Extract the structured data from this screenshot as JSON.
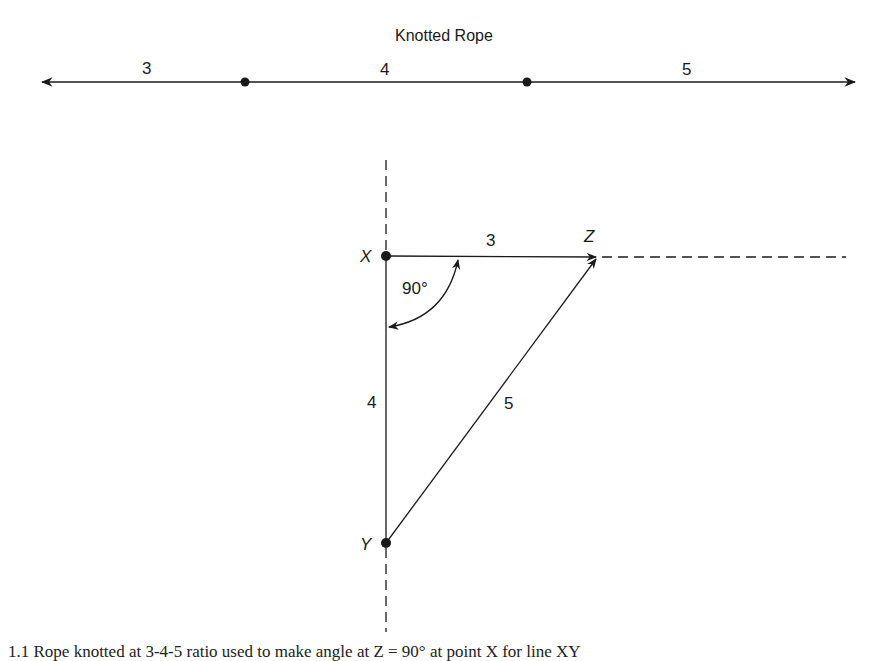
{
  "rope": {
    "title": "Knotted Rope",
    "segments": [
      {
        "label": "3"
      },
      {
        "label": "4"
      },
      {
        "label": "5"
      }
    ],
    "knot_count": 2
  },
  "triangle": {
    "points": {
      "X": {
        "label": "X"
      },
      "Y": {
        "label": "Y"
      },
      "Z": {
        "label": "Z"
      }
    },
    "sides": {
      "XZ": "3",
      "XY": "4",
      "YZ": "5"
    },
    "angle_label": "90°"
  },
  "caption": {
    "text": "1.1 Rope knotted at 3-4-5 ratio used to make angle at Z = 90° at point X for line XY"
  },
  "colors": {
    "line": "#1a1a1a",
    "background": "#ffffff"
  }
}
